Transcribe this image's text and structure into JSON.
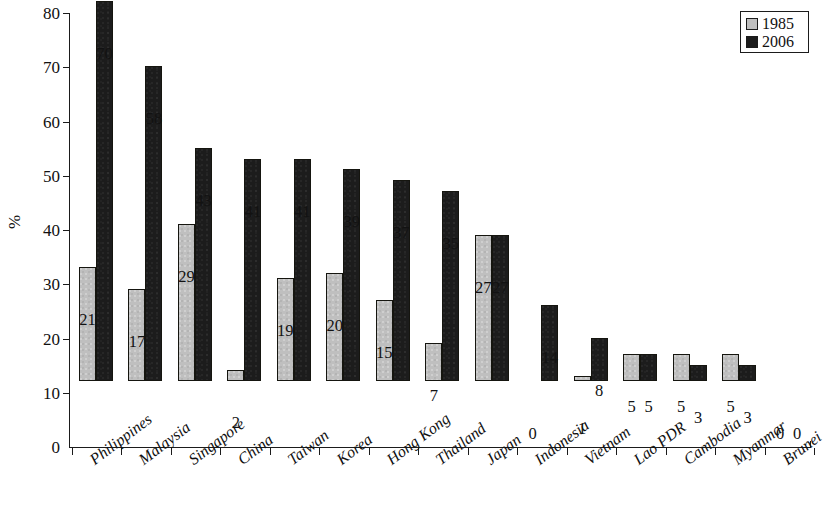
{
  "chart_data": {
    "type": "bar",
    "title": "",
    "xlabel": "",
    "ylabel": "%",
    "ylim": [
      0,
      80
    ],
    "ytick_step": 10,
    "yticks": [
      80,
      70,
      60,
      50,
      40,
      30,
      20,
      10,
      0
    ],
    "grid": false,
    "legend_position": "top-right",
    "categories": [
      "Philippines",
      "Malaysia",
      "Singapore",
      "China",
      "Taiwan",
      "Korea",
      "Hong Kong",
      "Thailand",
      "Japan",
      "Indonesia",
      "Vietnam",
      "Lao PDR",
      "Cambodia",
      "Myanmar",
      "Brunei"
    ],
    "series": [
      {
        "name": "1985",
        "color": "#bfbfbf",
        "values": [
          21,
          17,
          29,
          2,
          19,
          20,
          15,
          7,
          27,
          0,
          1,
          5,
          5,
          5,
          0
        ]
      },
      {
        "name": "2006",
        "color": "#1c1c1c",
        "values": [
          70,
          58,
          43,
          41,
          41,
          39,
          37,
          35,
          27,
          14,
          8,
          5,
          3,
          3,
          0
        ]
      }
    ]
  },
  "legend": {
    "entries": [
      {
        "label": "1985",
        "swatch": "gray-square-swatch"
      },
      {
        "label": "2006",
        "swatch": "black-square-swatch"
      }
    ]
  }
}
